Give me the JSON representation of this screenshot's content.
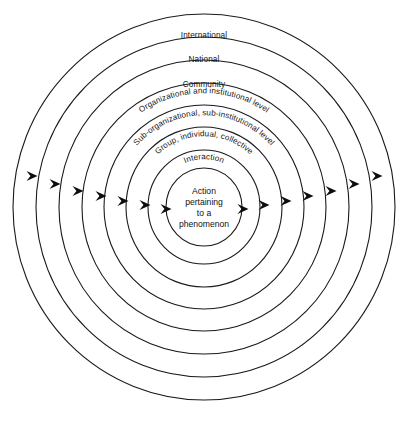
{
  "diagram": {
    "type": "concentric-circles",
    "center_x": 204,
    "center_y": 207,
    "background_color": "#ffffff",
    "stroke_color": "#1a1a1a",
    "arrow_color": "#0d0d0d",
    "rings": [
      {
        "index": 0,
        "label": "International",
        "label_style": "horizontal",
        "rx": 191,
        "ry": 193,
        "label_x": 204,
        "label_y": 38
      },
      {
        "index": 1,
        "label": "National",
        "label_style": "horizontal",
        "rx": 168,
        "ry": 170,
        "label_x": 204,
        "label_y": 62
      },
      {
        "index": 2,
        "label": "Community",
        "label_style": "horizontal",
        "rx": 145,
        "ry": 147,
        "label_x": 204,
        "label_y": 87
      },
      {
        "index": 3,
        "label": "Organizational and institutional level",
        "label_style": "curved",
        "rx": 122,
        "ry": 124,
        "text_radius": 112,
        "start_offset": "50%"
      },
      {
        "index": 4,
        "label": "Sub-organizational, sub-institutional level",
        "label_style": "curved",
        "rx": 100,
        "ry": 102,
        "text_radius": 90,
        "start_offset": "50%"
      },
      {
        "index": 5,
        "label": "Group, individual, collective",
        "label_style": "curved",
        "rx": 78,
        "ry": 80,
        "text_radius": 69,
        "start_offset": "50%"
      },
      {
        "index": 6,
        "label": "Interaction",
        "label_style": "curved",
        "rx": 56,
        "ry": 57,
        "text_radius": 47,
        "start_offset": "50%"
      },
      {
        "index": 7,
        "label": "",
        "label_style": "none",
        "rx": 38,
        "ry": 39,
        "text_radius": 0,
        "start_offset": "50%"
      }
    ],
    "center_label": {
      "lines": [
        "Action",
        "pertaining",
        "to a",
        "phenomenon"
      ],
      "x": 204,
      "y": 194,
      "line_height": 11
    },
    "arrows": {
      "direction": "rightward",
      "count": 14,
      "left_side": [
        {
          "x": 32,
          "y": 176
        },
        {
          "x": 55,
          "y": 184
        },
        {
          "x": 78,
          "y": 191
        },
        {
          "x": 101,
          "y": 196
        },
        {
          "x": 123,
          "y": 201
        },
        {
          "x": 145,
          "y": 205
        },
        {
          "x": 166,
          "y": 209
        }
      ],
      "right_side": [
        {
          "x": 243,
          "y": 209
        },
        {
          "x": 264,
          "y": 205
        },
        {
          "x": 286,
          "y": 201
        },
        {
          "x": 308,
          "y": 196
        },
        {
          "x": 331,
          "y": 191
        },
        {
          "x": 354,
          "y": 184
        },
        {
          "x": 377,
          "y": 176
        }
      ],
      "size": 11
    }
  }
}
